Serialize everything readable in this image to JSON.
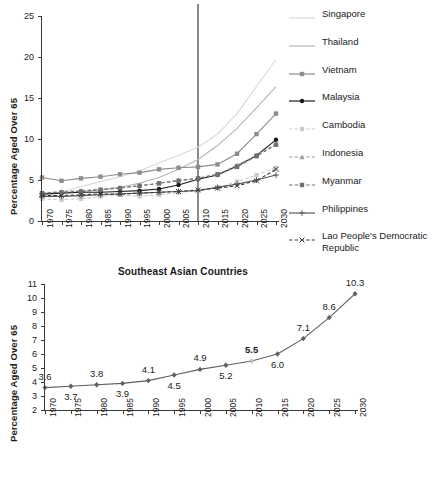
{
  "chart_data": [
    {
      "id": "top",
      "type": "line",
      "title": "",
      "xlabel": "",
      "ylabel": "Percentage Aged Over 65",
      "x": [
        1970,
        1975,
        1980,
        1985,
        1990,
        1995,
        2000,
        2005,
        2010,
        2015,
        2020,
        2025,
        2030
      ],
      "xtick_labels": [
        "1970",
        "1975",
        "1980",
        "1985",
        "1990",
        "1995",
        "2000",
        "2005",
        "2010",
        "2015",
        "2020",
        "2025",
        "2030"
      ],
      "ytick_labels": [
        "0",
        "5",
        "10",
        "15",
        "20",
        "25"
      ],
      "ylim": [
        0,
        25
      ],
      "ytick_step": 5,
      "grid": false,
      "legend_position": "right",
      "annotations": [
        {
          "type": "vertical-line",
          "x": 2010,
          "label": "2010 reference line"
        }
      ],
      "series": [
        {
          "name": "Singapore",
          "marker": "none",
          "dash": "solid",
          "color": "#d9d9d9",
          "values": [
            3.4,
            3.5,
            4.2,
            4.8,
            5.4,
            6.1,
            7.1,
            8.0,
            9.0,
            10.6,
            13.1,
            16.4,
            19.7
          ]
        },
        {
          "name": "Thailand",
          "marker": "none",
          "dash": "solid",
          "color": "#b5b5b5",
          "values": [
            3.2,
            3.4,
            3.6,
            3.8,
            4.1,
            4.6,
            5.3,
            6.3,
            7.5,
            9.2,
            11.3,
            13.8,
            16.4
          ]
        },
        {
          "name": "Vietnam",
          "marker": "square",
          "dash": "solid",
          "color": "#8c8c8c",
          "values": [
            5.3,
            4.9,
            5.2,
            5.4,
            5.7,
            5.9,
            6.3,
            6.5,
            6.6,
            6.9,
            8.2,
            10.6,
            13.1
          ]
        },
        {
          "name": "Malaysia",
          "marker": "circle",
          "dash": "solid",
          "color": "#1a1a1a",
          "values": [
            3.3,
            3.4,
            3.5,
            3.5,
            3.6,
            3.7,
            3.9,
            4.4,
            5.1,
            5.6,
            6.7,
            8.0,
            9.9
          ]
        },
        {
          "name": "Cambodia",
          "marker": "square",
          "dash": "dashed",
          "color": "#cccccc",
          "values": [
            2.7,
            2.6,
            2.7,
            3.0,
            3.2,
            3.0,
            3.2,
            3.5,
            3.7,
            4.1,
            4.8,
            5.6,
            6.5
          ]
        },
        {
          "name": "Indonesia",
          "marker": "triangle",
          "dash": "dashed",
          "color": "#9e9e9e",
          "values": [
            3.4,
            3.6,
            3.7,
            3.9,
            4.1,
            4.3,
            4.6,
            5.0,
            5.2,
            5.7,
            6.8,
            8.0,
            9.4
          ]
        },
        {
          "name": "Myanmar",
          "marker": "square",
          "dash": "dashed",
          "color": "#707070",
          "values": [
            3.4,
            3.5,
            3.6,
            3.8,
            4.0,
            4.3,
            4.6,
            4.9,
            5.2,
            5.7,
            6.6,
            7.9,
            9.3
          ]
        },
        {
          "name": "Philippines",
          "marker": "plus",
          "dash": "solid",
          "color": "#5a5a5a",
          "values": [
            3.0,
            3.0,
            3.1,
            3.2,
            3.3,
            3.4,
            3.5,
            3.6,
            3.7,
            4.1,
            4.5,
            5.0,
            5.6
          ]
        },
        {
          "name": "Lao People's Democratic Republic",
          "marker": "cross",
          "dash": "dashed",
          "color": "#3d3d3d",
          "values": [
            3.1,
            3.1,
            3.2,
            3.3,
            3.3,
            3.4,
            3.5,
            3.6,
            3.8,
            4.0,
            4.3,
            4.9,
            6.3
          ]
        }
      ]
    },
    {
      "id": "bottom",
      "type": "line",
      "title": "Southeast Asian Countries",
      "xlabel": "",
      "ylabel": "Percentage Aged Over 65",
      "x": [
        1970,
        1975,
        1980,
        1985,
        1990,
        1995,
        2000,
        2005,
        2010,
        2015,
        2020,
        2025,
        2030
      ],
      "xtick_labels": [
        "1970",
        "1975",
        "1980",
        "1985",
        "1990",
        "1995",
        "2000",
        "2005",
        "2010",
        "2015",
        "2020",
        "2025",
        "2030"
      ],
      "ytick_labels": [
        "2",
        "3",
        "4",
        "5",
        "6",
        "7",
        "8",
        "9",
        "10",
        "11"
      ],
      "ylim": [
        2,
        11
      ],
      "ytick_step": 1,
      "grid": false,
      "legend_position": "none",
      "series": [
        {
          "name": "Southeast Asia",
          "marker": "diamond",
          "dash": "solid",
          "color": "#5e5e5e",
          "values": [
            3.6,
            3.7,
            3.8,
            3.9,
            4.1,
            4.5,
            4.9,
            5.2,
            5.5,
            6.0,
            7.1,
            8.6,
            10.3
          ],
          "point_labels": [
            "3.6",
            "3.7",
            "3.8",
            "3.9",
            "4.1",
            "4.5",
            "4.9",
            "5.2",
            "5.5",
            "6.0",
            "7.1",
            "8.6",
            "10.3"
          ],
          "label_positions": [
            "above",
            "below",
            "above",
            "below",
            "above",
            "below",
            "above",
            "below",
            "above",
            "below",
            "above",
            "above",
            "above"
          ],
          "highlight_index": 8,
          "highlight_color": "#bdbdbd"
        }
      ]
    }
  ],
  "legend": {
    "items": [
      {
        "label": "Singapore"
      },
      {
        "label": "Thailand"
      },
      {
        "label": "Vietnam"
      },
      {
        "label": "Malaysia"
      },
      {
        "label": "Cambodia"
      },
      {
        "label": "Indonesia"
      },
      {
        "label": "Myanmar"
      },
      {
        "label": "Philippines"
      },
      {
        "label": "Lao People's Democratic Republic"
      }
    ]
  }
}
